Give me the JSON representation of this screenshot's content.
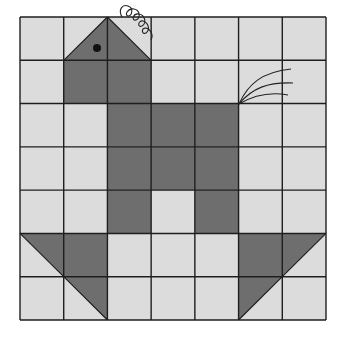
{
  "figure": {
    "grid": {
      "rows": 7,
      "cols": 7,
      "x0": 20,
      "y0": 17,
      "x1": 326,
      "y1": 320
    },
    "colors": {
      "background": "#ffffff",
      "light_cell": "#dcdcdc",
      "dark_cell": "#6e6e6e",
      "grid_line": "#1e1e1e",
      "ink": "#222222"
    },
    "shaded_full_cells": [
      {
        "row": 1,
        "col": 1
      },
      {
        "row": 1,
        "col": 2
      },
      {
        "row": 2,
        "col": 2
      },
      {
        "row": 2,
        "col": 3
      },
      {
        "row": 2,
        "col": 4
      },
      {
        "row": 3,
        "col": 2
      },
      {
        "row": 3,
        "col": 3
      },
      {
        "row": 3,
        "col": 4
      },
      {
        "row": 4,
        "col": 2
      },
      {
        "row": 4,
        "col": 4
      },
      {
        "row": 5,
        "col": 1
      },
      {
        "row": 5,
        "col": 5
      }
    ],
    "shaded_half_cells": [
      {
        "row": 0,
        "col": 1,
        "half": "bottom-right",
        "part": "head-left"
      },
      {
        "row": 0,
        "col": 2,
        "half": "bottom-left",
        "part": "head-right"
      },
      {
        "row": 5,
        "col": 0,
        "half": "top-right",
        "part": "left-foot-upper"
      },
      {
        "row": 6,
        "col": 1,
        "half": "top-right",
        "part": "left-foot-lower"
      },
      {
        "row": 5,
        "col": 6,
        "half": "top-left",
        "part": "right-foot-upper"
      },
      {
        "row": 6,
        "col": 5,
        "half": "top-left",
        "part": "right-foot-lower"
      }
    ],
    "eye": {
      "cx": 97,
      "cy": 48,
      "r": 4
    },
    "comb_label": "curly comb",
    "tail_label": "tail feathers"
  }
}
